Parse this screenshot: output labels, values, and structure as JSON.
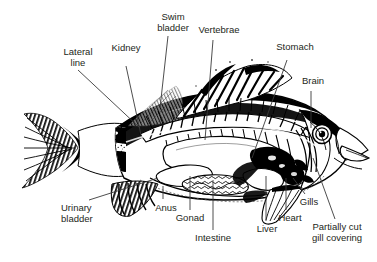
{
  "figure": {
    "style": "black-and-white engraving / line illustration",
    "background_color": "#ffffff",
    "ink_color": "#000000",
    "label_color": "#231f20"
  },
  "labels": [
    {
      "id": "lateral-line",
      "text": "Lateral\nline",
      "align": "center",
      "x": 47,
      "y": 47,
      "w": 62
    },
    {
      "id": "kidney",
      "text": "Kidney",
      "align": "center",
      "x": 103,
      "y": 43,
      "w": 46
    },
    {
      "id": "swim-bladder",
      "text": "Swim\nbladder",
      "align": "center",
      "x": 145,
      "y": 12,
      "w": 56
    },
    {
      "id": "vertebrae",
      "text": "Vertebrae",
      "align": "center",
      "x": 189,
      "y": 25,
      "w": 60
    },
    {
      "id": "stomach",
      "text": "Stomach",
      "align": "center",
      "x": 266,
      "y": 42,
      "w": 58
    },
    {
      "id": "brain",
      "text": "Brain",
      "align": "center",
      "x": 293,
      "y": 76,
      "w": 40
    },
    {
      "id": "urinary-bladder",
      "text": "Urinary\nbladder",
      "align": "left",
      "x": 61,
      "y": 203,
      "w": 56
    },
    {
      "id": "anus",
      "text": "Anus",
      "align": "center",
      "x": 148,
      "y": 203,
      "w": 36
    },
    {
      "id": "gonad",
      "text": "Gonad",
      "align": "center",
      "x": 168,
      "y": 213,
      "w": 44
    },
    {
      "id": "intestine",
      "text": "Intestine",
      "align": "center",
      "x": 187,
      "y": 233,
      "w": 52
    },
    {
      "id": "liver",
      "text": "Liver",
      "align": "center",
      "x": 250,
      "y": 224,
      "w": 34
    },
    {
      "id": "heart",
      "text": "Heart",
      "align": "center",
      "x": 271,
      "y": 213,
      "w": 38
    },
    {
      "id": "gills",
      "text": "Gills",
      "align": "center",
      "x": 293,
      "y": 197,
      "w": 32
    },
    {
      "id": "partially-cut-gill-covering",
      "text": "Partially cut\ngill covering",
      "align": "center",
      "x": 297,
      "y": 222,
      "w": 80
    }
  ],
  "leader_lines": [
    {
      "id": "lateral-line-leader",
      "from": [
        78,
        70
      ],
      "to": [
        140,
        128
      ]
    },
    {
      "id": "kidney-leader",
      "from": [
        126,
        66
      ],
      "to": [
        141,
        135
      ]
    },
    {
      "id": "swim-bladder-leader",
      "from": [
        168,
        36
      ],
      "to": [
        160,
        108
      ]
    },
    {
      "id": "vertebrae-leader",
      "from": [
        213,
        40
      ],
      "to": [
        205,
        140
      ]
    },
    {
      "id": "stomach-leader",
      "from": [
        287,
        60
      ],
      "to": [
        252,
        158
      ]
    },
    {
      "id": "brain-leader",
      "from": [
        311,
        91
      ],
      "to": [
        311,
        128
      ]
    },
    {
      "id": "urinary-bladder-leader",
      "from": [
        89,
        200
      ],
      "to": [
        158,
        178
      ]
    },
    {
      "id": "anus-leader",
      "from": [
        163,
        199
      ],
      "to": [
        163,
        186
      ]
    },
    {
      "id": "gonad-leader",
      "from": [
        190,
        210
      ],
      "to": [
        190,
        176
      ]
    },
    {
      "id": "intestine-leader",
      "from": [
        213,
        230
      ],
      "to": [
        213,
        180
      ]
    },
    {
      "id": "liver-leader",
      "from": [
        266,
        221
      ],
      "to": [
        266,
        176
      ]
    },
    {
      "id": "heart-leader",
      "from": [
        286,
        210
      ],
      "to": [
        286,
        178
      ]
    },
    {
      "id": "gills-leader",
      "from": [
        305,
        194
      ],
      "to": [
        293,
        178
      ]
    },
    {
      "id": "gill-covering-leader",
      "from": [
        335,
        219
      ],
      "to": [
        313,
        158
      ]
    }
  ]
}
